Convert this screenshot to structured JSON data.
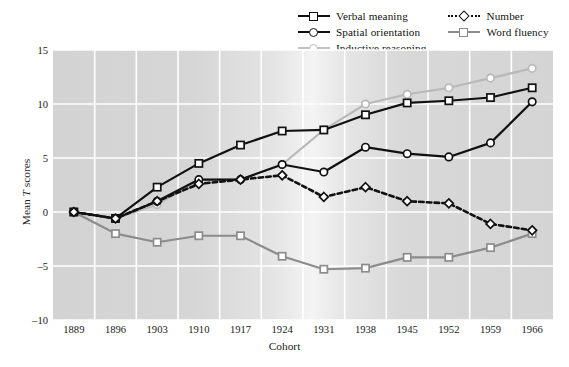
{
  "chart_data": {
    "type": "line",
    "title": "",
    "xlabel": "Cohort",
    "ylabel": "Mean T scores",
    "ylabel_parts": {
      "pre": "Mean ",
      "italic": "T",
      "post": " scores"
    },
    "categories": [
      "1889",
      "1896",
      "1903",
      "1910",
      "1917",
      "1924",
      "1931",
      "1938",
      "1945",
      "1952",
      "1959",
      "1966"
    ],
    "x": [
      1889,
      1896,
      1903,
      1910,
      1917,
      1924,
      1931,
      1938,
      1945,
      1952,
      1959,
      1966
    ],
    "ylim": [
      -10,
      15
    ],
    "yticks": [
      15,
      10,
      5,
      0,
      -5,
      -10
    ],
    "ytick_labels": [
      "15",
      "10",
      "5",
      "0",
      "-5",
      "-10"
    ],
    "grid": true,
    "legend_position": "top-right",
    "series": [
      {
        "name": "Verbal meaning",
        "color": "#111111",
        "marker": "square",
        "dash": "solid",
        "values": [
          0.0,
          -0.6,
          2.3,
          4.5,
          6.2,
          7.5,
          7.6,
          9.0,
          10.1,
          10.3,
          10.6,
          11.5
        ]
      },
      {
        "name": "Spatial orientation",
        "color": "#111111",
        "marker": "circle",
        "dash": "solid",
        "values": [
          0.0,
          -0.6,
          1.0,
          3.0,
          3.0,
          4.4,
          3.7,
          6.0,
          5.4,
          5.1,
          6.4,
          10.2
        ]
      },
      {
        "name": "Inductive reasoning",
        "color": "#b9b9b9",
        "marker": "circle",
        "dash": "solid",
        "values": [
          0.0,
          -0.6,
          0.7,
          3.0,
          3.0,
          4.4,
          7.6,
          10.0,
          10.9,
          11.5,
          12.4,
          13.3
        ]
      },
      {
        "name": "Number",
        "color": "#111111",
        "marker": "diamond",
        "dash": "dotted",
        "values": [
          0.0,
          -0.6,
          1.0,
          2.6,
          3.0,
          3.4,
          1.4,
          2.3,
          1.0,
          0.8,
          -1.1,
          -1.7
        ]
      },
      {
        "name": "Word fluency",
        "color": "#8c8c8c",
        "marker": "square",
        "dash": "solid",
        "values": [
          0.0,
          -2.0,
          -2.8,
          -2.2,
          -2.2,
          -4.1,
          -5.3,
          -5.2,
          -4.2,
          -4.2,
          -3.3,
          -2.0
        ]
      }
    ]
  },
  "legend": {
    "items": [
      {
        "label": "Verbal meaning"
      },
      {
        "label": "Number"
      },
      {
        "label": "Spatial orientation"
      },
      {
        "label": "Word fluency"
      },
      {
        "label": "Inductive reasoning"
      }
    ]
  },
  "axes": {
    "x_title": "Cohort",
    "y_title_pre": "Mean ",
    "y_title_italic": "T",
    "y_title_post": " scores"
  }
}
